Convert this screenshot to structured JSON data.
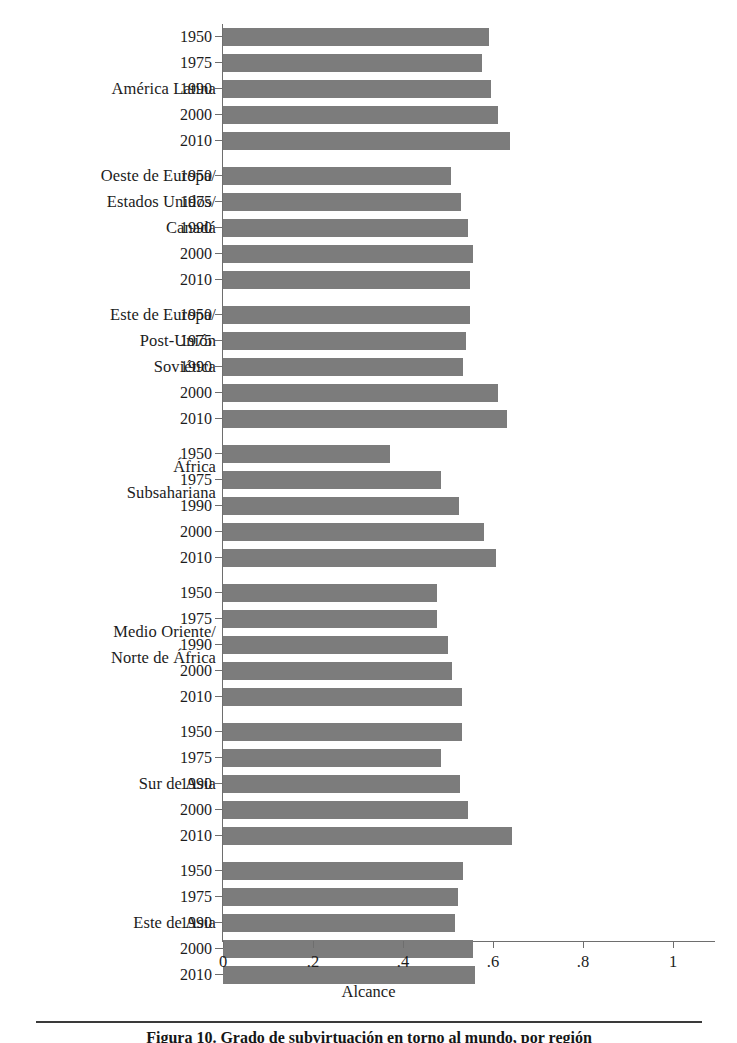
{
  "chart_data": {
    "type": "bar",
    "orientation": "horizontal",
    "title": "",
    "xlabel": "Alcance",
    "ylabel": "",
    "xlim": [
      0,
      1
    ],
    "xticks": [
      "0",
      ".2",
      ".4",
      ".6",
      ".8",
      "1"
    ],
    "xtick_values": [
      0,
      0.2,
      0.4,
      0.6,
      0.8,
      1
    ],
    "grid": false,
    "legend": "none",
    "bar_color": "#7c7c7c",
    "axis_color": "#6e6e6e",
    "categories": [
      "1950",
      "1975",
      "1990",
      "2000",
      "2010"
    ],
    "groups": [
      {
        "label_lines": [
          "América Latina"
        ],
        "label_row_index": 2,
        "categories": [
          "1950",
          "1975",
          "1990",
          "2000",
          "2010"
        ],
        "values": [
          0.59,
          0.575,
          0.595,
          0.61,
          0.638
        ]
      },
      {
        "label_lines": [
          "Oeste de Europa/",
          "Estados Unidos/",
          "Canadá"
        ],
        "label_row_index": 1,
        "categories": [
          "1950",
          "1975",
          "1990",
          "2000",
          "2010"
        ],
        "values": [
          0.507,
          0.529,
          0.545,
          0.556,
          0.549
        ]
      },
      {
        "label_lines": [
          "Este de Europa/",
          "Post-Unión",
          "Soviética"
        ],
        "label_row_index": 1,
        "categories": [
          "1950",
          "1975",
          "1990",
          "2000",
          "2010"
        ],
        "values": [
          0.549,
          0.54,
          0.533,
          0.611,
          0.631
        ]
      },
      {
        "label_lines": [
          "África",
          "Subsahariana"
        ],
        "label_row_index": 1,
        "categories": [
          "1950",
          "1975",
          "1990",
          "2000",
          "2010"
        ],
        "values": [
          0.371,
          0.485,
          0.524,
          0.58,
          0.607
        ]
      },
      {
        "label_lines": [
          "Medio Oriente/",
          "Norte de África"
        ],
        "label_row_index": 2,
        "categories": [
          "1950",
          "1975",
          "1990",
          "2000",
          "2010"
        ],
        "values": [
          0.475,
          0.475,
          0.5,
          0.508,
          0.531
        ]
      },
      {
        "label_lines": [
          "Sur de Asia"
        ],
        "label_row_index": 2,
        "categories": [
          "1950",
          "1975",
          "1990",
          "2000",
          "2010"
        ],
        "values": [
          0.531,
          0.484,
          0.527,
          0.545,
          0.642
        ]
      },
      {
        "label_lines": [
          "Este de Asia"
        ],
        "label_row_index": 2,
        "categories": [
          "1950",
          "1975",
          "1990",
          "2000",
          "2010"
        ],
        "values": [
          0.533,
          0.522,
          0.516,
          0.556,
          0.56
        ]
      }
    ]
  },
  "caption": {
    "text": "Figura 10. Grado de subvirtuación en torno al mundo, por región"
  }
}
